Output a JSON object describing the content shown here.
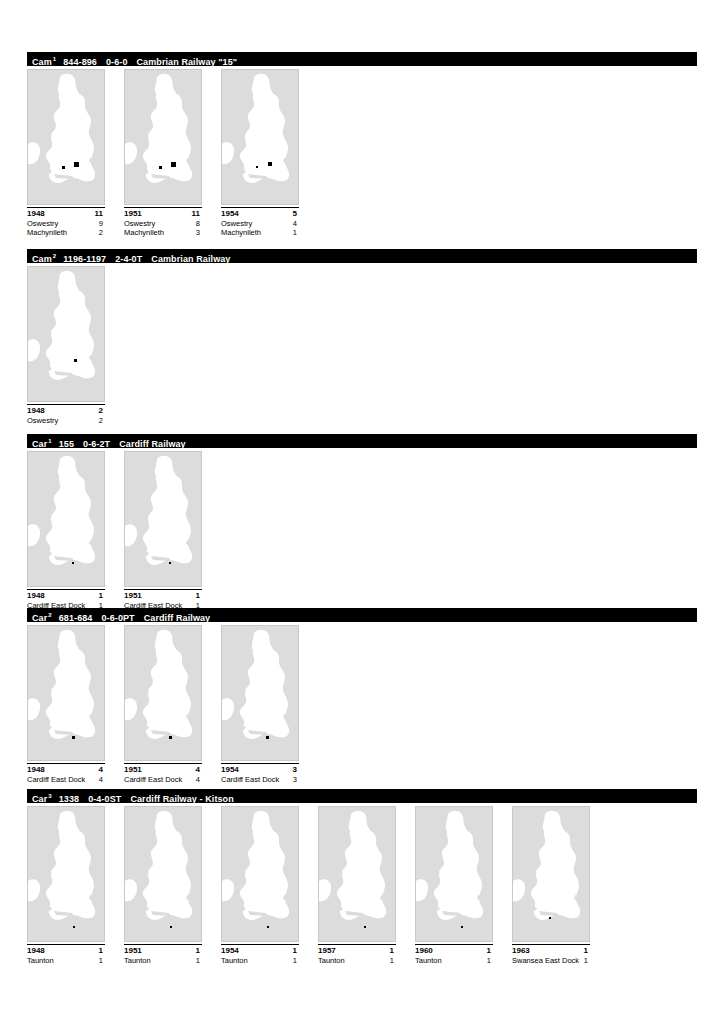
{
  "page": {
    "map_region": "Great Britain"
  },
  "sections": [
    {
      "class_code": "Cam",
      "class_sup": "1",
      "numbers": "844-896",
      "wheel_arrangement": "0-6-0",
      "origin": "Cambrian Railway \"15\"",
      "top": 52,
      "cells": [
        {
          "year": "1948",
          "total": "11",
          "depots": [
            {
              "name": "Oswestry",
              "count": "9",
              "x": 46,
              "y": 92,
              "size": 5
            },
            {
              "name": "Machynlleth",
              "count": "2",
              "x": 34,
              "y": 96,
              "size": 3
            }
          ]
        },
        {
          "year": "1951",
          "total": "11",
          "depots": [
            {
              "name": "Oswestry",
              "count": "8",
              "x": 46,
              "y": 92,
              "size": 5
            },
            {
              "name": "Machynlleth",
              "count": "3",
              "x": 34,
              "y": 96,
              "size": 3
            }
          ]
        },
        {
          "year": "1954",
          "total": "5",
          "depots": [
            {
              "name": "Oswestry",
              "count": "4",
              "x": 46,
              "y": 92,
              "size": 4
            },
            {
              "name": "Machynlleth",
              "count": "1",
              "x": 34,
              "y": 96,
              "size": 2
            }
          ]
        }
      ]
    },
    {
      "class_code": "Cam",
      "class_sup": "2",
      "numbers": "1196-1197",
      "wheel_arrangement": "2-4-0T",
      "origin": "Cambrian Railway",
      "top": 249,
      "cells": [
        {
          "year": "1948",
          "total": "2",
          "depots": [
            {
              "name": "Oswestry",
              "count": "2",
              "x": 46,
              "y": 92,
              "size": 3
            }
          ]
        }
      ]
    },
    {
      "class_code": "Car",
      "class_sup": "1",
      "numbers": "155",
      "wheel_arrangement": "0-6-2T",
      "origin": "Cardiff Railway",
      "top": 434,
      "cells": [
        {
          "year": "1948",
          "total": "1",
          "depots": [
            {
              "name": "Cardiff East Dock",
              "count": "1",
              "x": 44,
              "y": 110,
              "size": 2
            }
          ]
        },
        {
          "year": "1951",
          "total": "1",
          "depots": [
            {
              "name": "Cardiff East Dock",
              "count": "1",
              "x": 44,
              "y": 110,
              "size": 2
            }
          ]
        }
      ]
    },
    {
      "class_code": "Car",
      "class_sup": "2",
      "numbers": "681-684",
      "wheel_arrangement": "0-6-0PT",
      "origin": "Cardiff Railway",
      "top": 608,
      "cells": [
        {
          "year": "1948",
          "total": "4",
          "depots": [
            {
              "name": "Cardiff East Dock",
              "count": "4",
              "x": 44,
              "y": 110,
              "size": 3
            }
          ]
        },
        {
          "year": "1951",
          "total": "4",
          "depots": [
            {
              "name": "Cardiff East Dock",
              "count": "4",
              "x": 44,
              "y": 110,
              "size": 3
            }
          ]
        },
        {
          "year": "1954",
          "total": "3",
          "depots": [
            {
              "name": "Cardiff East Dock",
              "count": "3",
              "x": 44,
              "y": 110,
              "size": 3
            }
          ]
        }
      ]
    },
    {
      "class_code": "Car",
      "class_sup": "3",
      "numbers": "1338",
      "wheel_arrangement": "0-4-0ST",
      "origin": "Cardiff Railway - Kitson",
      "top": 789,
      "cells": [
        {
          "year": "1948",
          "total": "1",
          "depots": [
            {
              "name": "Taunton",
              "count": "1",
              "x": 45,
              "y": 119,
              "size": 2
            }
          ]
        },
        {
          "year": "1951",
          "total": "1",
          "depots": [
            {
              "name": "Taunton",
              "count": "1",
              "x": 45,
              "y": 119,
              "size": 2
            }
          ]
        },
        {
          "year": "1954",
          "total": "1",
          "depots": [
            {
              "name": "Taunton",
              "count": "1",
              "x": 45,
              "y": 119,
              "size": 2
            }
          ]
        },
        {
          "year": "1957",
          "total": "1",
          "depots": [
            {
              "name": "Taunton",
              "count": "1",
              "x": 45,
              "y": 119,
              "size": 2
            }
          ]
        },
        {
          "year": "1960",
          "total": "1",
          "depots": [
            {
              "name": "Taunton",
              "count": "1",
              "x": 45,
              "y": 119,
              "size": 2
            }
          ]
        },
        {
          "year": "1963",
          "total": "1",
          "depots": [
            {
              "name": "Swansea East Dock",
              "count": "1",
              "x": 36,
              "y": 110,
              "size": 2
            }
          ]
        }
      ]
    }
  ],
  "colors": {
    "header_bar": "#000000",
    "header_text": "#ffffff",
    "sea": "#dcdcdc",
    "land": "#ffffff",
    "marker": "#000000",
    "map_border": "#c8c8c8"
  }
}
